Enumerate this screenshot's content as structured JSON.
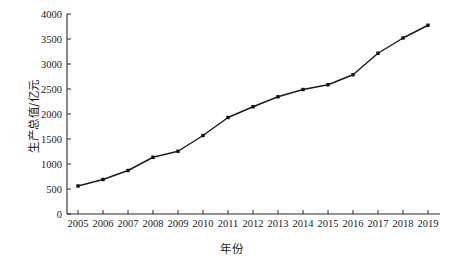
{
  "chart_data": {
    "type": "line",
    "title": "",
    "xlabel": "年份",
    "ylabel": "生产总值/亿元",
    "categories": [
      "2005",
      "2006",
      "2007",
      "2008",
      "2009",
      "2010",
      "2011",
      "2012",
      "2013",
      "2014",
      "2015",
      "2016",
      "2017",
      "2018",
      "2019"
    ],
    "x": [
      2005,
      2006,
      2007,
      2008,
      2009,
      2010,
      2011,
      2012,
      2013,
      2014,
      2015,
      2016,
      2017,
      2018,
      2019
    ],
    "values": [
      560,
      690,
      870,
      1135,
      1255,
      1570,
      1930,
      2145,
      2345,
      2490,
      2585,
      2785,
      3215,
      3520,
      3775
    ],
    "series": [
      {
        "name": "生产总值",
        "values": [
          560,
          690,
          870,
          1135,
          1255,
          1570,
          1930,
          2145,
          2345,
          2490,
          2585,
          2785,
          3215,
          3520,
          3775
        ]
      }
    ],
    "ylim": [
      0,
      4000
    ],
    "yticks": [
      0,
      500,
      1000,
      1500,
      2000,
      2500,
      3000,
      3500,
      4000
    ],
    "ytick_labels": [
      "0",
      "500",
      "1000",
      "1500",
      "2000",
      "2500",
      "3000",
      "3500",
      "4000"
    ],
    "xtick_labels": [
      "2005",
      "2006",
      "2007",
      "2008",
      "2009",
      "2010",
      "2011",
      "2012",
      "2013",
      "2014",
      "2015",
      "2016",
      "2017",
      "2018",
      "2019"
    ],
    "grid": false,
    "legend": false,
    "legend_position": "none",
    "marker": "filled-square",
    "line_color": "#1b1b1b",
    "marker_color": "#111111",
    "background_color": "#ffffff"
  }
}
